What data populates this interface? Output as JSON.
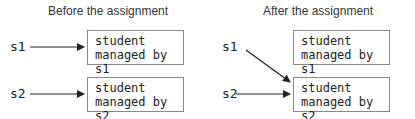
{
  "panels": [
    {
      "title": "Before the assignment",
      "vars": [
        "s1",
        "s2"
      ],
      "boxes": [
        {
          "line1": "student",
          "line2": "managed by s1"
        },
        {
          "line1": "student",
          "line2": "managed by s2"
        }
      ]
    },
    {
      "title": "After the assignment",
      "vars": [
        "s1",
        "s2"
      ],
      "boxes": [
        {
          "line1": "student",
          "line2": "managed by s1"
        },
        {
          "line1": "student",
          "line2": "managed by s2"
        }
      ]
    }
  ]
}
